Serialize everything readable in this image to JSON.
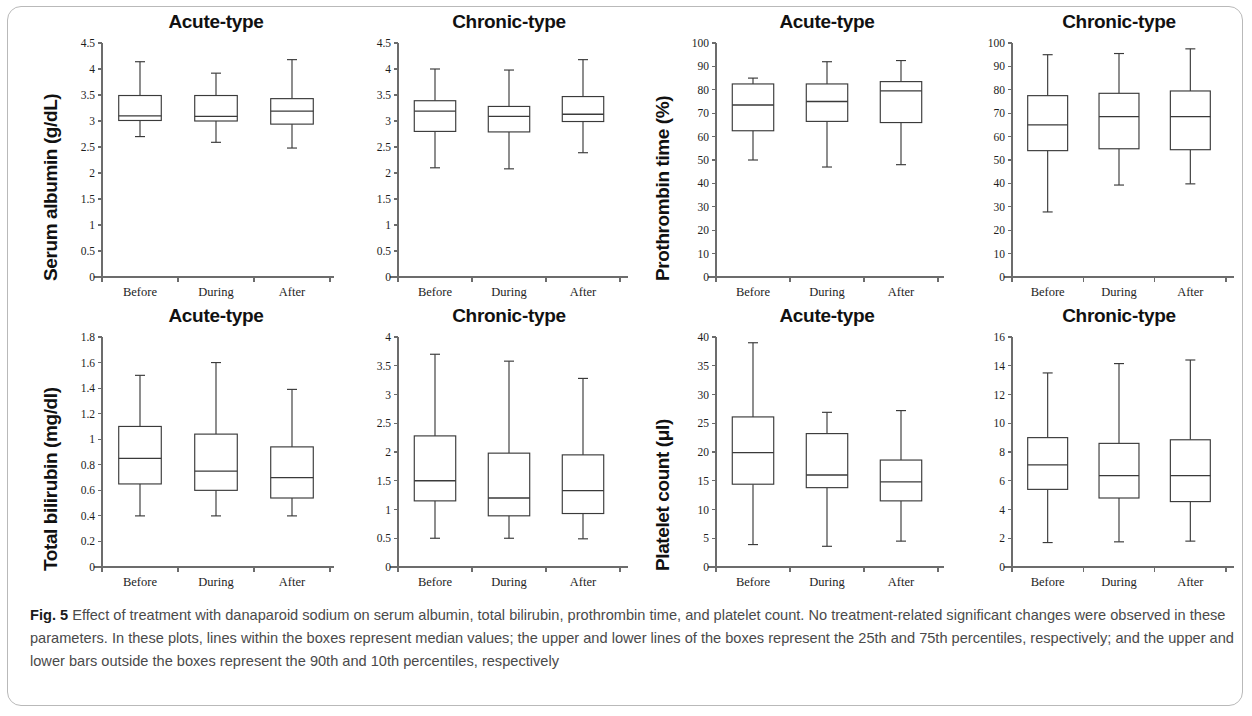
{
  "figure": {
    "label": "Fig. 5",
    "caption": "Effect of treatment with danaparoid sodium on serum albumin, total bilirubin, prothrombin time, and platelet count. No treatment-related significant changes were observed in these parameters. In these plots, lines within the boxes represent median values; the upper and lower lines of the boxes represent the 25th and 75th percentiles, respectively; and the upper and lower bars outside the boxes represent the 90th and 10th percentiles, respectively"
  },
  "chart_data": [
    {
      "id": "serum-albumin-acute",
      "type": "box",
      "title": "Acute-type",
      "ylabel": "Serum albumin (g/dL)",
      "xlabel": "",
      "categories": [
        "Before",
        "During",
        "After"
      ],
      "ylim": [
        0,
        4.5
      ],
      "yticks": [
        0,
        0.5,
        1,
        1.5,
        2,
        2.5,
        3,
        3.5,
        4,
        4.5
      ],
      "ytick_labels": [
        "0",
        "0.5",
        "1",
        "1.5",
        "2",
        "2.5",
        "3",
        "3.5",
        "4",
        "4.5"
      ],
      "grid": false,
      "boxes": [
        {
          "category": "Before",
          "p10": 2.7,
          "p25": 3.01,
          "median": 3.1,
          "p75": 3.49,
          "p90": 4.14
        },
        {
          "category": "During",
          "p10": 2.59,
          "p25": 3.0,
          "median": 3.09,
          "p75": 3.49,
          "p90": 3.92
        },
        {
          "category": "After",
          "p10": 2.48,
          "p25": 2.94,
          "median": 3.19,
          "p75": 3.43,
          "p90": 4.18
        }
      ]
    },
    {
      "id": "serum-albumin-chronic",
      "type": "box",
      "title": "Chronic-type",
      "ylabel": "",
      "xlabel": "",
      "categories": [
        "Before",
        "During",
        "After"
      ],
      "ylim": [
        0,
        4.5
      ],
      "yticks": [
        0,
        0.5,
        1,
        1.5,
        2,
        2.5,
        3,
        3.5,
        4,
        4.5
      ],
      "ytick_labels": [
        "0",
        "0.5",
        "1",
        "1.5",
        "2",
        "2.5",
        "3",
        "3.5",
        "4",
        "4.5"
      ],
      "grid": false,
      "boxes": [
        {
          "category": "Before",
          "p10": 2.1,
          "p25": 2.8,
          "median": 3.19,
          "p75": 3.39,
          "p90": 4.0
        },
        {
          "category": "During",
          "p10": 2.08,
          "p25": 2.79,
          "median": 3.09,
          "p75": 3.28,
          "p90": 3.98
        },
        {
          "category": "After",
          "p10": 2.39,
          "p25": 2.99,
          "median": 3.13,
          "p75": 3.47,
          "p90": 4.18
        }
      ]
    },
    {
      "id": "prothrombin-time-acute",
      "type": "box",
      "title": "Acute-type",
      "ylabel": "Prothrombin time (%)",
      "xlabel": "",
      "categories": [
        "Before",
        "During",
        "After"
      ],
      "ylim": [
        0,
        100
      ],
      "yticks": [
        0,
        10,
        20,
        30,
        40,
        50,
        60,
        70,
        80,
        90,
        100
      ],
      "ytick_labels": [
        "0",
        "10",
        "20",
        "30",
        "40",
        "50",
        "60",
        "70",
        "80",
        "90",
        "100"
      ],
      "grid": false,
      "boxes": [
        {
          "category": "Before",
          "p10": 50.0,
          "p25": 62.5,
          "median": 73.5,
          "p75": 82.5,
          "p90": 85.0
        },
        {
          "category": "During",
          "p10": 47.0,
          "p25": 66.5,
          "median": 75.0,
          "p75": 82.5,
          "p90": 92.0
        },
        {
          "category": "After",
          "p10": 48.0,
          "p25": 66.0,
          "median": 79.5,
          "p75": 83.5,
          "p90": 92.5
        }
      ]
    },
    {
      "id": "prothrombin-time-chronic",
      "type": "box",
      "title": "Chronic-type",
      "ylabel": "",
      "xlabel": "",
      "categories": [
        "Before",
        "During",
        "After"
      ],
      "ylim": [
        0,
        100
      ],
      "yticks": [
        0,
        10,
        20,
        30,
        40,
        50,
        60,
        70,
        80,
        90,
        100
      ],
      "ytick_labels": [
        "0",
        "10",
        "20",
        "30",
        "40",
        "50",
        "60",
        "70",
        "80",
        "90",
        "100"
      ],
      "grid": false,
      "boxes": [
        {
          "category": "Before",
          "p10": 27.8,
          "p25": 54.0,
          "median": 65.0,
          "p75": 77.5,
          "p90": 95.0
        },
        {
          "category": "During",
          "p10": 39.3,
          "p25": 54.8,
          "median": 68.5,
          "p75": 78.5,
          "p90": 95.5
        },
        {
          "category": "After",
          "p10": 39.8,
          "p25": 54.4,
          "median": 68.5,
          "p75": 79.5,
          "p90": 97.5
        }
      ]
    },
    {
      "id": "total-bilirubin-acute",
      "type": "box",
      "title": "Acute-type",
      "ylabel": "Total bilirubin (mg/dl)",
      "xlabel": "",
      "categories": [
        "Before",
        "During",
        "After"
      ],
      "ylim": [
        0,
        1.8
      ],
      "yticks": [
        0,
        0.2,
        0.4,
        0.6,
        0.8,
        1,
        1.2,
        1.4,
        1.6,
        1.8
      ],
      "ytick_labels": [
        "0",
        "0.2",
        "0.4",
        "0.6",
        "0.8",
        "1",
        "1.2",
        "1.4",
        "1.6",
        "1.8"
      ],
      "grid": false,
      "boxes": [
        {
          "category": "Before",
          "p10": 0.4,
          "p25": 0.65,
          "median": 0.85,
          "p75": 1.1,
          "p90": 1.5
        },
        {
          "category": "During",
          "p10": 0.4,
          "p25": 0.6,
          "median": 0.75,
          "p75": 1.04,
          "p90": 1.6
        },
        {
          "category": "After",
          "p10": 0.4,
          "p25": 0.54,
          "median": 0.7,
          "p75": 0.94,
          "p90": 1.39
        }
      ]
    },
    {
      "id": "total-bilirubin-chronic",
      "type": "box",
      "title": "Chronic-type",
      "ylabel": "",
      "xlabel": "",
      "categories": [
        "Before",
        "During",
        "After"
      ],
      "ylim": [
        0,
        4
      ],
      "yticks": [
        0,
        0.5,
        1,
        1.5,
        2,
        2.5,
        3,
        3.5,
        4
      ],
      "ytick_labels": [
        "0",
        "0.5",
        "1",
        "1.5",
        "2",
        "2.5",
        "3",
        "3.5",
        "4"
      ],
      "grid": false,
      "boxes": [
        {
          "category": "Before",
          "p10": 0.5,
          "p25": 1.15,
          "median": 1.5,
          "p75": 2.28,
          "p90": 3.7
        },
        {
          "category": "During",
          "p10": 0.5,
          "p25": 0.89,
          "median": 1.2,
          "p75": 1.98,
          "p90": 3.58
        },
        {
          "category": "After",
          "p10": 0.49,
          "p25": 0.93,
          "median": 1.33,
          "p75": 1.95,
          "p90": 3.28
        }
      ]
    },
    {
      "id": "platelet-count-acute",
      "type": "box",
      "title": "Acute-type",
      "ylabel": "Platelet count (μl)",
      "xlabel": "",
      "categories": [
        "Before",
        "During",
        "After"
      ],
      "ylim": [
        0,
        40
      ],
      "yticks": [
        0,
        5,
        10,
        15,
        20,
        25,
        30,
        35,
        40
      ],
      "ytick_labels": [
        "0",
        "5",
        "10",
        "15",
        "20",
        "25",
        "30",
        "35",
        "40"
      ],
      "grid": false,
      "boxes": [
        {
          "category": "Before",
          "p10": 3.9,
          "p25": 14.4,
          "median": 19.9,
          "p75": 26.1,
          "p90": 39.0
        },
        {
          "category": "During",
          "p10": 3.6,
          "p25": 13.8,
          "median": 16.0,
          "p75": 23.2,
          "p90": 26.9
        },
        {
          "category": "After",
          "p10": 4.5,
          "p25": 11.5,
          "median": 14.8,
          "p75": 18.6,
          "p90": 27.2
        }
      ]
    },
    {
      "id": "platelet-count-chronic",
      "type": "box",
      "title": "Chronic-type",
      "ylabel": "",
      "xlabel": "",
      "categories": [
        "Before",
        "During",
        "After"
      ],
      "ylim": [
        0,
        16
      ],
      "yticks": [
        0,
        2,
        4,
        6,
        8,
        10,
        12,
        14,
        16
      ],
      "ytick_labels": [
        "0",
        "2",
        "4",
        "6",
        "8",
        "10",
        "12",
        "14",
        "16"
      ],
      "grid": false,
      "boxes": [
        {
          "category": "Before",
          "p10": 1.7,
          "p25": 5.4,
          "median": 7.1,
          "p75": 9.0,
          "p90": 13.5
        },
        {
          "category": "During",
          "p10": 1.75,
          "p25": 4.8,
          "median": 6.35,
          "p75": 8.6,
          "p90": 14.15
        },
        {
          "category": "After",
          "p10": 1.8,
          "p25": 4.55,
          "median": 6.35,
          "p75": 8.85,
          "p90": 14.4
        }
      ]
    }
  ]
}
